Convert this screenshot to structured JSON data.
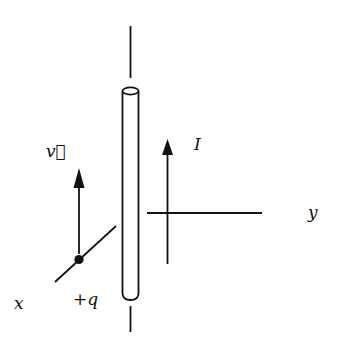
{
  "diagram": {
    "title": "",
    "colors": {
      "ink": "#111111",
      "background": "#ffffff"
    },
    "elements": {
      "wire": {
        "label": "",
        "description": "long straight current-carrying wire (cylinder) along vertical axis"
      },
      "current_arrow": {
        "label": "I",
        "direction": "up"
      },
      "velocity_arrow": {
        "label": "v⃗",
        "direction": "up"
      },
      "charge": {
        "label": "+q"
      },
      "x_axis": {
        "label": "x"
      },
      "y_axis": {
        "label": "y"
      }
    }
  }
}
